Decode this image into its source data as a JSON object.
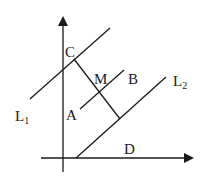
{
  "diagram": {
    "type": "geometry",
    "axes": {
      "x_axis": {
        "from": [
          41,
          158
        ],
        "to": [
          193,
          158
        ],
        "arrow": true
      },
      "y_axis": {
        "from": [
          63,
          172
        ],
        "to": [
          63,
          17
        ],
        "arrow": true
      }
    },
    "lines": [
      {
        "name": "L1",
        "from": [
          30,
          99
        ],
        "to": [
          110,
          28
        ]
      },
      {
        "name": "L2",
        "from": [
          76,
          158
        ],
        "to": [
          166,
          77
        ]
      },
      {
        "name": "CE",
        "from": [
          74,
          59
        ],
        "to": [
          120,
          119
        ]
      },
      {
        "name": "AB",
        "from": [
          80,
          109
        ],
        "to": [
          124,
          70
        ]
      }
    ],
    "labels": {
      "C": "C",
      "M": "M",
      "B": "B",
      "A": "A",
      "D": "D",
      "L1_main": "L",
      "L1_sub": "1",
      "L2_main": "L",
      "L2_sub": "2"
    },
    "colors": {
      "stroke": "#1a1a1a",
      "background": "#ffffff"
    }
  }
}
